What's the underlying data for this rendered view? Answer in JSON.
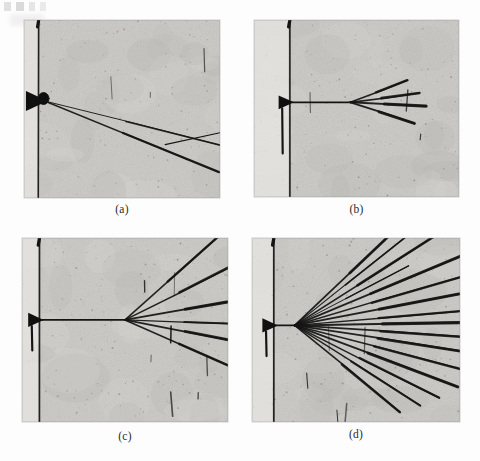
{
  "figure": {
    "kind": "photographic-plate-array",
    "background_color": "#fdfdfd",
    "plate_color": "#c9c9c6",
    "track_color": "#121212",
    "panel_count": 4,
    "columns": 2,
    "rows": 2
  },
  "panels": [
    {
      "id": "a",
      "caption": "(a)",
      "x": 24,
      "y": 20,
      "width": 196,
      "height": 178,
      "caption_y": 203,
      "description": "single forward track emerging from dark wedge-shaped target at left edge, with one late small-angle split near right",
      "beam_line_x_frac": 0.075,
      "vertex": {
        "x_frac": 0.105,
        "y_frac": 0.455
      },
      "prong_count": 2,
      "prongs": [
        {
          "angle_deg": 22.0,
          "length_frac": 0.96,
          "width": 1.5
        },
        {
          "angle_deg": 14.0,
          "length_frac": 0.95,
          "width": 1.0
        }
      ],
      "split_point_frac": {
        "x": 0.72,
        "y": 0.7
      }
    },
    {
      "id": "b",
      "caption": "(b)",
      "x": 254,
      "y": 20,
      "width": 205,
      "height": 177,
      "caption_y": 203,
      "description": "four-prong narrow jet fanning out to the right of the vertex, tracks thicken toward their ends",
      "beam_line_x_frac": 0.175,
      "vertex": {
        "x_frac": 0.47,
        "y_frac": 0.465
      },
      "prong_count": 4,
      "prongs": [
        {
          "angle_deg": -22.0,
          "length_frac": 0.3,
          "width": 1.6
        },
        {
          "angle_deg": -8.0,
          "length_frac": 0.34,
          "width": 1.7
        },
        {
          "angle_deg": 3.0,
          "length_frac": 0.37,
          "width": 2.0
        },
        {
          "angle_deg": 19.0,
          "length_frac": 0.33,
          "width": 1.9
        }
      ]
    },
    {
      "id": "c",
      "caption": "(c)",
      "x": 22,
      "y": 238,
      "width": 206,
      "height": 184,
      "caption_y": 430,
      "description": "six-prong jet, vertex near centre-left, prongs spread over a wider cone and reach the right edge; several short stray tracks in the field",
      "beam_line_x_frac": 0.085,
      "vertex": {
        "x_frac": 0.5,
        "y_frac": 0.445
      },
      "prong_count": 6,
      "prongs": [
        {
          "angle_deg": -42.0,
          "length_frac": 0.62,
          "width": 1.5
        },
        {
          "angle_deg": -27.0,
          "length_frac": 0.66,
          "width": 1.6
        },
        {
          "angle_deg": -10.0,
          "length_frac": 0.66,
          "width": 1.9
        },
        {
          "angle_deg": 2.0,
          "length_frac": 0.64,
          "width": 1.3
        },
        {
          "angle_deg": 11.0,
          "length_frac": 0.66,
          "width": 1.8
        },
        {
          "angle_deg": 24.0,
          "length_frac": 0.64,
          "width": 1.6
        }
      ],
      "stray_tracks": 7
    },
    {
      "id": "d",
      "caption": "(d)",
      "x": 252,
      "y": 238,
      "width": 208,
      "height": 184,
      "caption_y": 428,
      "description": "high-multiplicity jet, roughly sixteen prongs fanning from a vertex just right of the beam line and filling the right two thirds of the plate",
      "beam_line_x_frac": 0.105,
      "vertex": {
        "x_frac": 0.205,
        "y_frac": 0.475
      },
      "prong_count": 16,
      "prongs": [
        {
          "angle_deg": -44.0,
          "length_frac": 0.82,
          "width": 1.7
        },
        {
          "angle_deg": -39.0,
          "length_frac": 0.7,
          "width": 1.1
        },
        {
          "angle_deg": -33.0,
          "length_frac": 0.8,
          "width": 1.6
        },
        {
          "angle_deg": -28.0,
          "length_frac": 0.62,
          "width": 1.0
        },
        {
          "angle_deg": -23.0,
          "length_frac": 0.88,
          "width": 1.8
        },
        {
          "angle_deg": -16.5,
          "length_frac": 0.86,
          "width": 1.5
        },
        {
          "angle_deg": -11.0,
          "length_frac": 0.92,
          "width": 1.9
        },
        {
          "angle_deg": -5.0,
          "length_frac": 0.9,
          "width": 1.4
        },
        {
          "angle_deg": -1.0,
          "length_frac": 0.94,
          "width": 2.0
        },
        {
          "angle_deg": 4.0,
          "length_frac": 0.92,
          "width": 1.6
        },
        {
          "angle_deg": 9.0,
          "length_frac": 0.9,
          "width": 1.8
        },
        {
          "angle_deg": 15.0,
          "length_frac": 0.88,
          "width": 1.5
        },
        {
          "angle_deg": 21.0,
          "length_frac": 0.84,
          "width": 1.9
        },
        {
          "angle_deg": 27.0,
          "length_frac": 0.78,
          "width": 1.5
        },
        {
          "angle_deg": 33.0,
          "length_frac": 0.72,
          "width": 1.3
        },
        {
          "angle_deg": 40.0,
          "length_frac": 0.66,
          "width": 1.6
        }
      ]
    }
  ]
}
